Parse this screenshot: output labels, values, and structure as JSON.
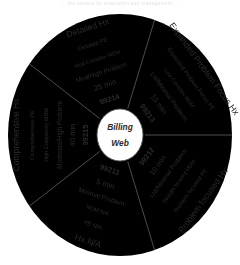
{
  "scan": {
    "header_text": "... the content for evaluation and management ..."
  },
  "diagram": {
    "title": "Billing Web",
    "hub_line1": "Billing",
    "hub_line2": "Web",
    "ring_count": 7,
    "sector_count": 5,
    "stroke_color": "#6f6f6f",
    "text_color": "#2b2b2b",
    "background": "#ffffff"
  },
  "chart_data": {
    "type": "pie",
    "title": "Billing Web",
    "xlabel": "",
    "ylabel": "",
    "center_label": "Billing Web",
    "legend_position": "none",
    "grid": false,
    "ring_names": [
      "code",
      "time",
      "problem",
      "mdm",
      "pe",
      "hx"
    ],
    "ring_labels": [
      "CPT Code",
      "Typical Time",
      "Presenting Problem",
      "Medical Decision Making",
      "Physical Exam",
      "History"
    ],
    "categories": [
      "99215",
      "99214",
      "99213",
      "99212",
      "99211"
    ],
    "values": [
      20,
      20,
      20,
      20,
      20
    ],
    "series": [
      {
        "name": "99215",
        "start_angle": 234,
        "end_angle": 306,
        "code": "99215",
        "time": "40 min",
        "problem": "Moderate/High Problem",
        "mdm": "High Complexity MDM",
        "pe": "Comprehensive PE",
        "hx": "Comprehensive Hx"
      },
      {
        "name": "99214",
        "start_angle": 306,
        "end_angle": 18,
        "code": "99214",
        "time": "25 min",
        "problem": "Mod/High Problem",
        "mdm": "Mod Complex MDM",
        "pe": "Detailed PE",
        "hx": "Detailed Hx"
      },
      {
        "name": "99213",
        "start_angle": 18,
        "end_angle": 90,
        "code": "99213",
        "time": "15 min",
        "problem": "Ltd/Minimal Problem",
        "mdm": "Low Complex MDM",
        "pe": "Expanded Problem Focus PE",
        "hx": "Expanded Problem Focus Hx"
      },
      {
        "name": "99212",
        "start_angle": 90,
        "end_angle": 162,
        "code": "99212",
        "time": "10 min",
        "problem": "Ltd/Minimal Problem",
        "mdm": "Straight forward MDM",
        "pe": "Problem focused PE",
        "hx": "Problem focused Hx"
      },
      {
        "name": "99211",
        "start_angle": 162,
        "end_angle": 234,
        "code": "99211",
        "time": "5 min",
        "problem": "Minimal Problem",
        "mdm": "MDM N/A",
        "pe": "PE N/A",
        "hx": "Hx N/A"
      }
    ]
  }
}
